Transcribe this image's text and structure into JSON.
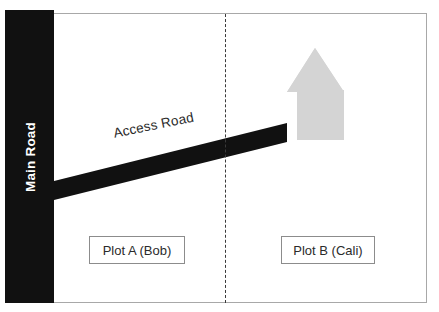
{
  "diagram": {
    "type": "site-plan",
    "frame": {
      "border_color": "#a8a8a8"
    },
    "main_road": {
      "label": "Main Road",
      "color": "#111111",
      "label_color": "#ffffff",
      "orientation": "vertical",
      "position": "left edge"
    },
    "access_road": {
      "label": "Access Road",
      "color": "#111111",
      "label_color": "#2b2b2b",
      "orientation": "diagonal",
      "description": "runs from Main Road up to the right toward the house"
    },
    "divider": {
      "style": "dashed",
      "color": "#3a3a3a",
      "orientation": "vertical",
      "description": "boundary between Plot A and Plot B"
    },
    "house": {
      "label": "house",
      "fill_color": "#d4d4d4",
      "located_on": "Plot B (Cali)"
    },
    "plots": [
      {
        "id": "plot-a",
        "label": "Plot A (Bob)",
        "owner": "Bob",
        "border_color": "#8c8c8c"
      },
      {
        "id": "plot-b",
        "label": "Plot B (Cali)",
        "owner": "Cali",
        "border_color": "#8c8c8c"
      }
    ]
  }
}
